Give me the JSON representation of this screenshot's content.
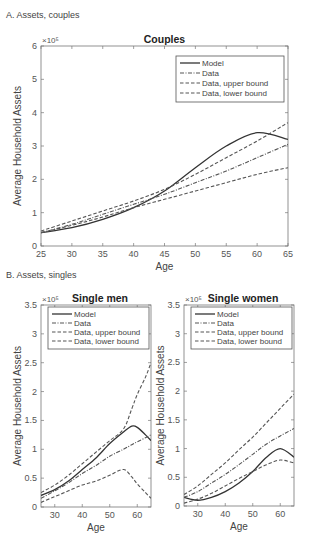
{
  "panels": {
    "a_label": "A. Assets, couples",
    "b_label": "B. Assets, singles"
  },
  "legend": [
    "Model",
    "Data",
    "Data, upper bound",
    "Data, lower bound"
  ],
  "exponent_label": "×10⁵",
  "chart_data": [
    {
      "type": "line",
      "title": "Couples",
      "xlabel": "Age",
      "ylabel": "Average Household Assets",
      "xlim": [
        25,
        65
      ],
      "ylim": [
        0,
        600000
      ],
      "y_scale_note": "×10^5",
      "xticks": [
        25,
        30,
        35,
        40,
        45,
        50,
        55,
        60,
        65
      ],
      "yticks": [
        0,
        1,
        2,
        3,
        4,
        5,
        6
      ],
      "legend_position": "upper right",
      "x": [
        25,
        30,
        35,
        40,
        45,
        50,
        55,
        60,
        65
      ],
      "series": [
        {
          "name": "Model",
          "style": "solid",
          "values": [
            40000,
            55000,
            80000,
            115000,
            165000,
            235000,
            300000,
            340000,
            320000
          ]
        },
        {
          "name": "Data",
          "style": "dashdot",
          "values": [
            40000,
            65000,
            95000,
            125000,
            155000,
            190000,
            225000,
            265000,
            305000
          ]
        },
        {
          "name": "Data, upper bound",
          "style": "dashed",
          "values": [
            45000,
            75000,
            105000,
            135000,
            170000,
            215000,
            265000,
            315000,
            370000
          ]
        },
        {
          "name": "Data, lower bound",
          "style": "dashed",
          "values": [
            40000,
            62000,
            87000,
            115000,
            140000,
            165000,
            190000,
            215000,
            235000
          ]
        }
      ]
    },
    {
      "type": "line",
      "title": "Single men",
      "xlabel": "Age",
      "ylabel": "Average Household Assets",
      "xlim": [
        25,
        65
      ],
      "ylim": [
        0,
        350000
      ],
      "y_scale_note": "×10^5",
      "xticks": [
        30,
        40,
        50,
        60
      ],
      "yticks": [
        0,
        0.5,
        1,
        1.5,
        2,
        2.5,
        3,
        3.5
      ],
      "legend_position": "upper left",
      "x": [
        25,
        30,
        35,
        40,
        45,
        50,
        55,
        58,
        60,
        63,
        65
      ],
      "series": [
        {
          "name": "Model",
          "style": "solid",
          "values": [
            20000,
            30000,
            45000,
            65000,
            85000,
            110000,
            130000,
            140000,
            138000,
            125000,
            115000
          ]
        },
        {
          "name": "Data",
          "style": "dashdot",
          "values": [
            15000,
            28000,
            42000,
            58000,
            72000,
            88000,
            100000,
            108000,
            113000,
            120000,
            125000
          ]
        },
        {
          "name": "Data, upper bound",
          "style": "dashed",
          "values": [
            25000,
            38000,
            55000,
            75000,
            95000,
            115000,
            135000,
            170000,
            195000,
            225000,
            250000
          ]
        },
        {
          "name": "Data, lower bound",
          "style": "dashed",
          "values": [
            8000,
            18000,
            28000,
            38000,
            45000,
            55000,
            65000,
            52000,
            40000,
            25000,
            15000
          ]
        }
      ]
    },
    {
      "type": "line",
      "title": "Single women",
      "xlabel": "Age",
      "ylabel": "Average Household Assets",
      "xlim": [
        25,
        65
      ],
      "ylim": [
        0,
        350000
      ],
      "y_scale_note": "×10^5",
      "xticks": [
        30,
        40,
        50,
        60
      ],
      "yticks": [
        0,
        0.5,
        1,
        1.5,
        2,
        2.5,
        3,
        3.5
      ],
      "legend_position": "upper left",
      "x": [
        25,
        30,
        35,
        40,
        45,
        50,
        55,
        60,
        65
      ],
      "series": [
        {
          "name": "Model",
          "style": "solid",
          "values": [
            15000,
            10000,
            15000,
            25000,
            40000,
            60000,
            85000,
            100000,
            85000
          ]
        },
        {
          "name": "Data",
          "style": "dashdot",
          "values": [
            15000,
            25000,
            40000,
            55000,
            72000,
            90000,
            108000,
            122000,
            135000
          ]
        },
        {
          "name": "Data, upper bound",
          "style": "dashed",
          "values": [
            20000,
            35000,
            55000,
            75000,
            98000,
            120000,
            145000,
            170000,
            195000
          ]
        },
        {
          "name": "Data, lower bound",
          "style": "dashed",
          "values": [
            5000,
            12000,
            22000,
            35000,
            48000,
            60000,
            72000,
            80000,
            75000
          ]
        }
      ]
    }
  ]
}
